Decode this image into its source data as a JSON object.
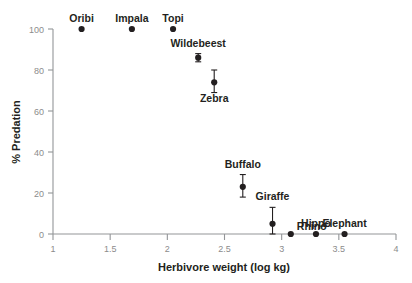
{
  "chart_data": {
    "type": "scatter",
    "title": "",
    "xlabel": "Herbivore weight (log kg)",
    "ylabel": "% Predation",
    "xlim": [
      1,
      4
    ],
    "ylim": [
      0,
      100
    ],
    "xticks": [
      1,
      1.5,
      2,
      2.5,
      3,
      3.5,
      4
    ],
    "xtick_labels": [
      "1",
      "1.5",
      "2",
      "2.5",
      "3",
      "3.5",
      "4"
    ],
    "yticks": [
      0,
      20,
      40,
      60,
      80,
      100
    ],
    "ytick_labels": [
      "0",
      "20",
      "40",
      "60",
      "80",
      "100"
    ],
    "grid": false,
    "legend": "none",
    "points": [
      {
        "label": "Oribi",
        "x": 1.25,
        "y": 100,
        "yerr_low": 100,
        "yerr_high": 100,
        "label_position": "above"
      },
      {
        "label": "Impala",
        "x": 1.69,
        "y": 100,
        "yerr_low": 100,
        "yerr_high": 100,
        "label_position": "above"
      },
      {
        "label": "Topi",
        "x": 2.05,
        "y": 100,
        "yerr_low": 100,
        "yerr_high": 100,
        "label_position": "above"
      },
      {
        "label": "Wildebeest",
        "x": 2.27,
        "y": 86,
        "yerr_low": 84,
        "yerr_high": 88,
        "label_position": "above"
      },
      {
        "label": "Zebra",
        "x": 2.41,
        "y": 74,
        "yerr_low": 69,
        "yerr_high": 80,
        "label_position": "below"
      },
      {
        "label": "Buffalo",
        "x": 2.66,
        "y": 23,
        "yerr_low": 18,
        "yerr_high": 29,
        "label_position": "above"
      },
      {
        "label": "Giraffe",
        "x": 2.92,
        "y": 5,
        "yerr_low": 0,
        "yerr_high": 13,
        "label_position": "above"
      },
      {
        "label": "Rhino",
        "x": 3.08,
        "y": 0,
        "yerr_low": 0,
        "yerr_high": 0,
        "label_position": "above-right"
      },
      {
        "label": "Hippo",
        "x": 3.3,
        "y": 0,
        "yerr_low": 0,
        "yerr_high": 0,
        "label_position": "above"
      },
      {
        "label": "Elephant",
        "x": 3.55,
        "y": 0,
        "yerr_low": 0,
        "yerr_high": 0,
        "label_position": "above"
      }
    ]
  },
  "colors": {
    "background": "#ffffff",
    "axis": "#939598",
    "tick_text": "#8c8c8c",
    "marker": "#231f20",
    "label_text": "#231f20"
  }
}
